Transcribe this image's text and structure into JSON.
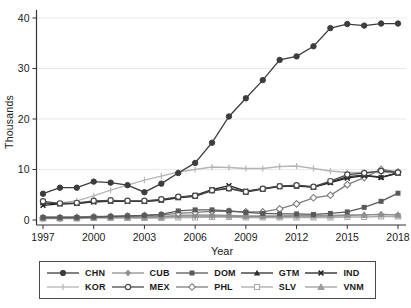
{
  "figure": {
    "ylabel": "Thousands",
    "xlabel": "Year"
  },
  "chart_data": {
    "type": "line",
    "title": "",
    "xlabel": "Year",
    "ylabel": "Thousands",
    "grid": true,
    "legend_position": "bottom",
    "xlim": [
      1997,
      2018
    ],
    "ylim": [
      0,
      40
    ],
    "x_ticks": [
      1997,
      2000,
      2003,
      2006,
      2009,
      2012,
      2015,
      2018
    ],
    "y_ticks": [
      0,
      10,
      20,
      30,
      40
    ],
    "x": [
      1997,
      1998,
      1999,
      2000,
      2001,
      2002,
      2003,
      2004,
      2005,
      2006,
      2007,
      2008,
      2009,
      2010,
      2011,
      2012,
      2013,
      2014,
      2015,
      2016,
      2017,
      2018
    ],
    "legend_rows": [
      [
        "CHN",
        "CUB",
        "DOM",
        "GTM",
        "IND"
      ],
      [
        "KOR",
        "MEX",
        "PHL",
        "SLV",
        "VNM"
      ]
    ],
    "z_order": [
      "SLV",
      "VNM",
      "CUB",
      "PHL",
      "DOM",
      "KOR",
      "IND",
      "GTM",
      "MEX",
      "CHN"
    ],
    "series": [
      {
        "name": "CHN",
        "marker": "circle-filled",
        "color": "#3d3d3d",
        "values": [
          5.2,
          6.4,
          6.4,
          7.6,
          7.4,
          6.9,
          5.5,
          7.2,
          9.3,
          11.3,
          15.3,
          20.5,
          24.1,
          27.7,
          31.7,
          32.4,
          34.4,
          38.0,
          38.8,
          38.5,
          38.9,
          38.9
        ]
      },
      {
        "name": "CUB",
        "marker": "diamond-filled",
        "color": "#8f8f8f",
        "values": [
          0.6,
          0.6,
          0.6,
          0.7,
          0.7,
          0.6,
          0.6,
          0.7,
          0.8,
          0.8,
          0.8,
          0.8,
          0.7,
          0.7,
          0.7,
          0.8,
          0.8,
          0.8,
          0.9,
          1.0,
          1.1,
          1.0
        ]
      },
      {
        "name": "DOM",
        "marker": "square-filled",
        "color": "#5a5a5a",
        "values": [
          0.5,
          0.5,
          0.5,
          0.6,
          0.7,
          0.8,
          0.9,
          1.1,
          1.8,
          2.0,
          2.0,
          1.8,
          1.5,
          1.3,
          1.2,
          1.2,
          1.1,
          1.3,
          1.6,
          2.5,
          3.7,
          5.3
        ]
      },
      {
        "name": "GTM",
        "marker": "triangle-filled",
        "color": "#2e2e2e",
        "values": [
          3.4,
          3.2,
          3.3,
          3.6,
          3.7,
          3.7,
          3.7,
          3.9,
          4.4,
          4.7,
          5.8,
          6.2,
          5.5,
          6.1,
          6.6,
          6.7,
          6.5,
          7.5,
          8.6,
          8.9,
          8.5,
          9.3
        ]
      },
      {
        "name": "IND",
        "marker": "x",
        "color": "#1f1f1f",
        "values": [
          2.9,
          3.2,
          3.3,
          3.6,
          3.8,
          3.7,
          3.7,
          4.0,
          4.5,
          4.9,
          6.0,
          6.8,
          5.7,
          6.2,
          6.7,
          6.8,
          6.5,
          7.4,
          8.3,
          8.8,
          8.4,
          9.3
        ]
      },
      {
        "name": "KOR",
        "marker": "tick",
        "color": "#b5b5b5",
        "values": [
          3.2,
          3.4,
          3.8,
          4.8,
          5.9,
          6.9,
          7.9,
          8.7,
          9.5,
          10.0,
          10.5,
          10.4,
          10.2,
          10.2,
          10.6,
          10.7,
          10.2,
          9.7,
          9.4,
          9.4,
          9.4,
          9.4
        ]
      },
      {
        "name": "MEX",
        "marker": "circle-open",
        "color": "#4a4a4a",
        "values": [
          3.7,
          3.3,
          3.4,
          3.8,
          3.9,
          3.8,
          3.8,
          4.1,
          4.6,
          4.8,
          5.9,
          6.3,
          5.6,
          6.2,
          6.7,
          6.9,
          6.6,
          7.7,
          9.0,
          9.3,
          9.7,
          9.4
        ]
      },
      {
        "name": "PHL",
        "marker": "diamond-open",
        "color": "#7d7d7d",
        "values": [
          0.4,
          0.4,
          0.5,
          0.6,
          0.7,
          0.8,
          0.9,
          1.0,
          1.3,
          1.5,
          1.7,
          1.7,
          1.6,
          1.6,
          2.2,
          3.2,
          4.4,
          4.9,
          7.0,
          8.4,
          10.0,
          9.5
        ]
      },
      {
        "name": "SLV",
        "marker": "square-open",
        "color": "#ababab",
        "values": [
          0.3,
          0.3,
          0.3,
          0.4,
          0.4,
          0.4,
          0.4,
          0.4,
          0.5,
          0.5,
          0.6,
          0.6,
          0.5,
          0.5,
          0.5,
          0.5,
          0.5,
          0.5,
          0.6,
          0.6,
          0.7,
          0.7
        ]
      },
      {
        "name": "VNM",
        "marker": "triangle-light",
        "color": "#9e9e9e",
        "values": [
          0.4,
          0.4,
          0.4,
          0.5,
          0.5,
          0.5,
          0.5,
          0.6,
          0.9,
          1.0,
          1.0,
          0.9,
          0.8,
          0.8,
          0.8,
          0.9,
          0.9,
          0.9,
          1.0,
          1.0,
          1.1,
          1.0
        ]
      }
    ],
    "colors": {
      "gridline": "#e9e9e9",
      "axis": "#333333",
      "tick_label": "#222222",
      "legend_border": "#4a4a4a"
    }
  }
}
